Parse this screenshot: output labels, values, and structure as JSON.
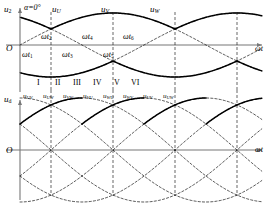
{
  "figure": {
    "type": "three-phase-bridge-rectifier-waveforms",
    "firing_angle": "α=0°",
    "axis_time_label": "ωt",
    "origin_label": "O"
  },
  "upper_plot": {
    "y_axis_label": "u2",
    "y_axis_label_main": "u",
    "y_axis_label_sub": "2",
    "alpha_note": "α=0°",
    "phase_labels": [
      {
        "main": "u",
        "sub": "U"
      },
      {
        "main": "u",
        "sub": "V"
      },
      {
        "main": "u",
        "sub": "W"
      }
    ],
    "commutation_labels_above": [
      {
        "main": "ωt",
        "sub": "2"
      },
      {
        "main": "ωt",
        "sub": "4"
      },
      {
        "main": "ωt",
        "sub": "6"
      }
    ],
    "commutation_labels_below": [
      {
        "main": "ωt",
        "sub": "1"
      },
      {
        "main": "ωt",
        "sub": "3"
      },
      {
        "main": "ωt",
        "sub": "5"
      }
    ],
    "interval_numerals": [
      "I",
      "II",
      "III",
      "IV",
      "V",
      "VI"
    ]
  },
  "lower_plot": {
    "y_axis_label_main": "u",
    "y_axis_label_sub": "d",
    "line_voltage_labels": [
      {
        "main": "u",
        "sub": "UV"
      },
      {
        "main": "u",
        "sub": "UW"
      },
      {
        "main": "u",
        "sub": "VW"
      },
      {
        "main": "u",
        "sub": "VU"
      },
      {
        "main": "u",
        "sub": "WU"
      },
      {
        "main": "u",
        "sub": "WV"
      },
      {
        "main": "u",
        "sub": "UV"
      },
      {
        "main": "u",
        "sub": "UW"
      }
    ]
  },
  "chart_data": {
    "type": "line",
    "title": "",
    "xlabel": "ωt",
    "ylabel": "u2 / ud",
    "grid": false,
    "legend": "inline-labels",
    "series": [
      {
        "name": "uU",
        "phase_deg": 0,
        "amplitude": 1,
        "style": "envelope-solid-dashed"
      },
      {
        "name": "uV",
        "phase_deg": 120,
        "amplitude": 1,
        "style": "envelope-solid-dashed"
      },
      {
        "name": "uW",
        "phase_deg": 240,
        "amplitude": 1,
        "style": "envelope-solid-dashed"
      }
    ],
    "annotations": [
      "α=0°",
      "ωt1",
      "ωt2",
      "ωt3",
      "ωt4",
      "ωt5",
      "ωt6",
      "I",
      "II",
      "III",
      "IV",
      "V",
      "VI"
    ]
  },
  "colors": {
    "stroke": "#000000",
    "axis": "#555555",
    "background": "#ffffff"
  }
}
